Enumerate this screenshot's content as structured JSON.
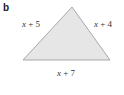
{
  "figure": {
    "part_label": "b",
    "shape": "triangle",
    "fill_color": "#e6e6e6",
    "stroke_color": "#a8a8a8",
    "sides": {
      "left": {
        "variable": "x",
        "expr_rest": " + 5"
      },
      "right": {
        "variable": "x",
        "expr_rest": " + 4"
      },
      "bottom": {
        "variable": "x",
        "expr_rest": " + 7"
      }
    }
  }
}
